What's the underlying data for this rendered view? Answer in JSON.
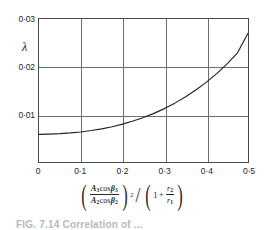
{
  "figure": {
    "caption_partial": "FIG. 7.14 Correlation of ..."
  },
  "axes": {
    "y_label": "λ",
    "y_ticks": [
      "0·03",
      "0·02",
      "0·01",
      "0"
    ],
    "x_ticks": [
      "0",
      "0·1",
      "0·2",
      "0·3",
      "0·4",
      "0·5"
    ],
    "x_formula": {
      "numerator_var": "A",
      "numerator_sub": "3",
      "cos": "cos",
      "numerator_beta_sub": "3",
      "denominator_var": "A",
      "denominator_sub": "2",
      "denominator_beta_sub": "2",
      "beta": "β",
      "exponent": "2",
      "divider": "/",
      "one": "1",
      "plus": "+",
      "r_num": "r",
      "r_num_sub": "2",
      "r_den": "r",
      "r_den_sub": "1"
    }
  },
  "chart_data": {
    "type": "line",
    "title": "",
    "xlabel": "(A3 cos β3 / A2 cos β2)^2 / (1 + r2/r1)",
    "ylabel": "λ",
    "xlim": [
      0,
      0.5
    ],
    "ylim": [
      0,
      0.03
    ],
    "grid": true,
    "legend": "none",
    "x_tick_values": [
      0,
      0.1,
      0.2,
      0.3,
      0.4,
      0.5
    ],
    "y_tick_values": [
      0,
      0.01,
      0.02,
      0.03
    ],
    "series": [
      {
        "name": "lambda",
        "color": "#222222",
        "x": [
          0.0,
          0.025,
          0.05,
          0.075,
          0.1,
          0.125,
          0.15,
          0.175,
          0.2,
          0.225,
          0.25,
          0.275,
          0.3,
          0.325,
          0.35,
          0.375,
          0.4,
          0.425,
          0.45,
          0.475,
          0.5
        ],
        "values": [
          0.0058,
          0.00585,
          0.00595,
          0.0061,
          0.0063,
          0.0066,
          0.00695,
          0.0074,
          0.00795,
          0.0086,
          0.00935,
          0.0102,
          0.0112,
          0.01235,
          0.01365,
          0.0151,
          0.0167,
          0.01855,
          0.0206,
          0.0229,
          0.027
        ]
      }
    ]
  }
}
